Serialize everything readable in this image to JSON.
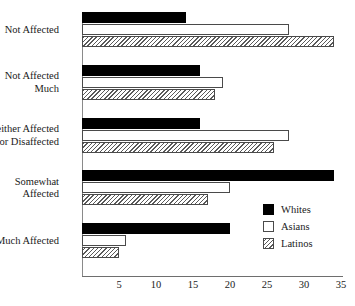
{
  "chart_data": {
    "type": "bar",
    "orientation": "horizontal",
    "title": "",
    "subtitle": "",
    "xlabel": "",
    "ylabel": "",
    "xlim": [
      0,
      35
    ],
    "xticks": [
      5,
      10,
      15,
      20,
      25,
      30,
      35
    ],
    "grid": false,
    "legend_position": "inside-right",
    "categories": [
      "Not Affected",
      "Not Affected\nMuch",
      "Neither Affected\nNor Disaffected",
      "Somewhat\nAffected",
      "Much Affected"
    ],
    "series": [
      {
        "name": "Whites",
        "pattern": "solid-black",
        "color": "#000000",
        "values": [
          14,
          16,
          16,
          34,
          20
        ]
      },
      {
        "name": "Asians",
        "pattern": "outline-white",
        "color": "#ffffff",
        "values": [
          28,
          19,
          28,
          20,
          6
        ]
      },
      {
        "name": "Latinos",
        "pattern": "diagonal-hatch",
        "color": "#5a5a5a",
        "values": [
          34,
          18,
          26,
          17,
          5
        ]
      }
    ]
  },
  "legend": {
    "items": [
      {
        "label": "Whites",
        "swatch": "solid-black-swatch"
      },
      {
        "label": "Asians",
        "swatch": "outline-white-swatch"
      },
      {
        "label": "Latinos",
        "swatch": "diagonal-hatch-swatch"
      }
    ]
  },
  "axis": {
    "tick_labels": [
      "5",
      "10",
      "15",
      "20",
      "25",
      "30",
      "35"
    ]
  }
}
